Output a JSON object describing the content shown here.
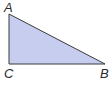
{
  "diagram": {
    "type": "right-triangle",
    "fill_color": "#c6cdee",
    "stroke_color": "#3a3a3a",
    "vertices": [
      {
        "label": "A",
        "x": 9,
        "y": 14,
        "label_x": 4,
        "label_y": 12
      },
      {
        "label": "B",
        "x": 105,
        "y": 64,
        "label_x": 100,
        "label_y": 78
      },
      {
        "label": "C",
        "x": 9,
        "y": 64,
        "label_x": 4,
        "label_y": 78
      }
    ],
    "right_angle_at": "C",
    "sides": [
      "AC",
      "CB",
      "AB"
    ]
  }
}
